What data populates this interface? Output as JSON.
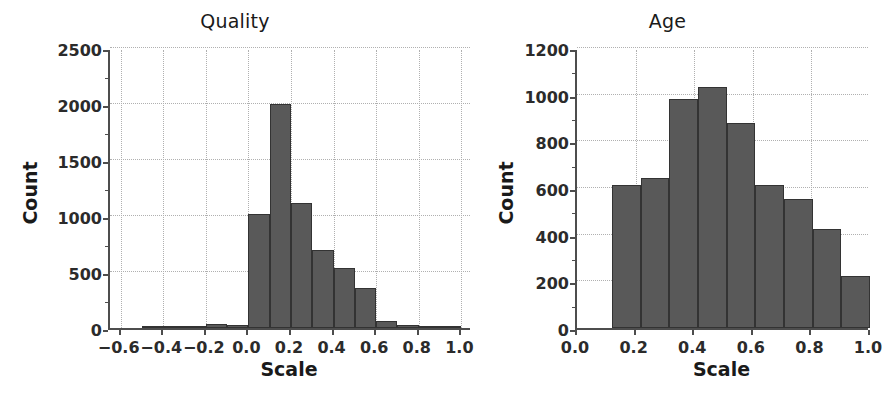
{
  "figure": {
    "background_color": "#ffffff",
    "bar_color": "#595959",
    "bar_edge_color": "#333333",
    "grid_color": "#b0b0b0",
    "axis_color": "#4d4d4d"
  },
  "panels": [
    {
      "id": "quality",
      "title": "Quality",
      "xlabel": "Scale",
      "ylabel": "Count"
    },
    {
      "id": "age",
      "title": "Age",
      "xlabel": "Scale",
      "ylabel": "Count"
    }
  ],
  "chart_data": [
    {
      "type": "bar",
      "title": "Quality",
      "xlabel": "Scale",
      "ylabel": "Count",
      "grid": true,
      "legend": null,
      "xlim": [
        -0.65,
        1.05
      ],
      "ylim": [
        0,
        2500
      ],
      "xticks": [
        -0.6,
        -0.4,
        -0.2,
        0.0,
        0.2,
        0.4,
        0.6,
        0.8,
        1.0
      ],
      "xtick_labels": [
        "−0.6",
        "−0.4",
        "−0.2",
        "0.0",
        "0.2",
        "0.4",
        "0.6",
        "0.8",
        "1.0"
      ],
      "yticks": [
        0,
        500,
        1000,
        1500,
        2000,
        2500
      ],
      "ytick_labels": [
        "0",
        "500",
        "1000",
        "1500",
        "2000",
        "2500"
      ],
      "bin_edges": [
        -0.5,
        -0.4,
        -0.3,
        -0.2,
        -0.1,
        0.0,
        0.1,
        0.2,
        0.3,
        0.4,
        0.5,
        0.6,
        0.7,
        0.8,
        0.9,
        1.0
      ],
      "bin_centers": [
        -0.45,
        -0.35,
        -0.25,
        -0.15,
        -0.05,
        0.05,
        0.15,
        0.25,
        0.35,
        0.45,
        0.55,
        0.65,
        0.75,
        0.85,
        0.95
      ],
      "values": [
        10,
        10,
        8,
        35,
        30,
        1020,
        2000,
        1120,
        700,
        535,
        355,
        65,
        30,
        18,
        8
      ]
    },
    {
      "type": "bar",
      "title": "Age",
      "xlabel": "Scale",
      "ylabel": "Count",
      "grid": true,
      "legend": null,
      "xlim": [
        0.0,
        1.0
      ],
      "ylim": [
        0,
        1200
      ],
      "xticks": [
        0.0,
        0.2,
        0.4,
        0.6,
        0.8,
        1.0
      ],
      "xtick_labels": [
        "0.0",
        "0.2",
        "0.4",
        "0.6",
        "0.8",
        "1.0"
      ],
      "yticks": [
        0,
        200,
        400,
        600,
        800,
        1000,
        1200
      ],
      "ytick_labels": [
        "0",
        "200",
        "400",
        "600",
        "800",
        "1000",
        "1200"
      ],
      "bin_edges": [
        0.12,
        0.2178,
        0.3156,
        0.4133,
        0.5111,
        0.6089,
        0.7067,
        0.8044,
        0.9022,
        1.0
      ],
      "bin_centers": [
        0.1689,
        0.2667,
        0.3644,
        0.4622,
        0.56,
        0.6578,
        0.7556,
        0.8533,
        0.9511
      ],
      "values": [
        615,
        645,
        980,
        1035,
        880,
        615,
        555,
        425,
        225
      ]
    }
  ]
}
